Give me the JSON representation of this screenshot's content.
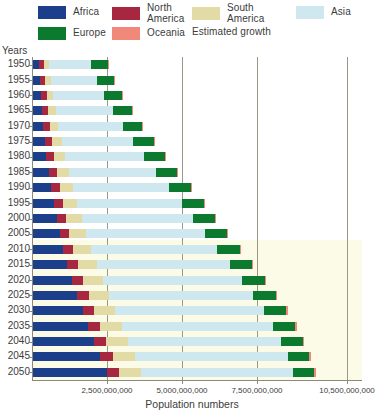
{
  "legend": {
    "items": [
      {
        "label": "Africa",
        "color": "#1b3f8b",
        "two_line": false
      },
      {
        "label": "North America",
        "color": "#a82740",
        "two_line": true
      },
      {
        "label": "South America",
        "color": "#e2dba6",
        "two_line": true
      },
      {
        "label": "Asia",
        "color": "#cfe8f0",
        "two_line": false
      },
      {
        "label": "Europe",
        "color": "#0b7a2e",
        "two_line": false
      },
      {
        "label": "Oceania",
        "color": "#f0897a",
        "two_line": false
      },
      {
        "label": "Estimated growth",
        "color": "#fcfbe8",
        "two_line": false
      }
    ]
  },
  "axes": {
    "y_title": "Years",
    "x_title": "Population numbers",
    "x_ticks": [
      "2,500,000,000",
      "5,000,000,000",
      "7,500,000,000",
      "10,500,000,000"
    ],
    "x_tick_values": [
      2500000000,
      5000000000,
      7500000000,
      10500000000
    ],
    "x_min": 0,
    "x_max": 11000000000
  },
  "chart_data": {
    "type": "bar",
    "orientation": "horizontal",
    "stacked": true,
    "title": "",
    "xlabel": "Population numbers",
    "ylabel": "Years",
    "xlim": [
      0,
      11000000000
    ],
    "grid": true,
    "legend_position": "top",
    "categories": [
      "1950",
      "1955",
      "1960",
      "1965",
      "1970",
      "1975",
      "1980",
      "1985",
      "1990",
      "1995",
      "2000",
      "2005",
      "2010",
      "2015",
      "2020",
      "2025",
      "2030",
      "2035",
      "2040",
      "2045",
      "2050"
    ],
    "series": [
      {
        "name": "Africa",
        "color": "#1b3f8b",
        "values": [
          228000000,
          254000000,
          285000000,
          322000000,
          366000000,
          419000000,
          481000000,
          556000000,
          640000000,
          731000000,
          819000000,
          920000000,
          1039000000,
          1182000000,
          1341000000,
          1508000000,
          1688000000,
          1878000000,
          2077000000,
          2282000000,
          2489000000
        ]
      },
      {
        "name": "North America",
        "color": "#a82740",
        "values": [
          172000000,
          187000000,
          204000000,
          219000000,
          231000000,
          243000000,
          254000000,
          266000000,
          280000000,
          296000000,
          313000000,
          329000000,
          344000000,
          358000000,
          369000000,
          380000000,
          390000000,
          398000000,
          405000000,
          411000000,
          415000000
        ]
      },
      {
        "name": "South America",
        "color": "#e2dba6",
        "values": [
          169000000,
          193000000,
          220000000,
          250000000,
          285000000,
          322000000,
          362000000,
          401000000,
          442000000,
          481000000,
          521000000,
          557000000,
          591000000,
          624000000,
          654000000,
          681000000,
          704000000,
          722000000,
          735000000,
          743000000,
          746000000
        ]
      },
      {
        "name": "Asia",
        "color": "#cfe8f0",
        "values": [
          1404000000,
          1534000000,
          1700000000,
          1899000000,
          2143000000,
          2397000000,
          2637000000,
          2908000000,
          3221000000,
          3488000000,
          3730000000,
          3975000000,
          4210000000,
          4434000000,
          4641000000,
          4810000000,
          4947000000,
          5038000000,
          5085000000,
          5094000000,
          5063000000
        ]
      },
      {
        "name": "Europe",
        "color": "#0b7a2e",
        "values": [
          549000000,
          575000000,
          605000000,
          635000000,
          657000000,
          676000000,
          694000000,
          707000000,
          721000000,
          727000000,
          726000000,
          729000000,
          736000000,
          743000000,
          748000000,
          746000000,
          741000000,
          733000000,
          723000000,
          711000000,
          696000000
        ]
      },
      {
        "name": "Oceania",
        "color": "#f0897a",
        "values": [
          13000000,
          14000000,
          16000000,
          18000000,
          20000000,
          21000000,
          23000000,
          25000000,
          27000000,
          29000000,
          31000000,
          34000000,
          37000000,
          40000000,
          43000000,
          46000000,
          49000000,
          52000000,
          55000000,
          57000000,
          60000000
        ]
      }
    ],
    "totals": [
      2535000000,
      2757000000,
      3030000000,
      3343000000,
      3702000000,
      4078000000,
      4451000000,
      4863000000,
      5331000000,
      5752000000,
      6140000000,
      6544000000,
      6957000000,
      7381000000,
      7796000000,
      8171000000,
      8519000000,
      8821000000,
      9080000000,
      9298000000,
      9469000000
    ],
    "estimated_growth_from": "2010",
    "annotations": [
      "Estimated growth shading covers projection years 2010-2050"
    ]
  }
}
